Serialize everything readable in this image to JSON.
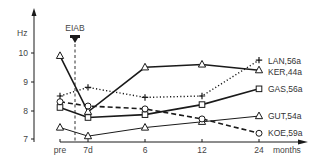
{
  "chart_data": {
    "type": "line",
    "title": "",
    "xlabel": "months",
    "ylabel": "Hz",
    "categories": [
      "pre",
      "7d",
      "6",
      "12",
      "24"
    ],
    "ylim": [
      7,
      10.3
    ],
    "yticks": [
      7,
      8,
      9,
      10
    ],
    "grid": false,
    "legend_position": "right, inline at line ends",
    "annotation": {
      "label": "EIAB",
      "at": "between pre and 7d",
      "marker": "down-arrow with dashed vertical line"
    },
    "series": [
      {
        "name": "LAN,56a",
        "marker": "+",
        "line": "dotted",
        "values": [
          8.5,
          8.8,
          8.45,
          8.5,
          9.75
        ]
      },
      {
        "name": "KER,44a",
        "marker": "triangle",
        "line": "solid-thick",
        "values": [
          9.9,
          7.95,
          9.5,
          9.6,
          9.4
        ]
      },
      {
        "name": "GAS,56a",
        "marker": "square",
        "line": "solid-thick",
        "values": [
          8.1,
          7.75,
          7.85,
          8.2,
          8.75
        ]
      },
      {
        "name": "GUT,54a",
        "marker": "triangle",
        "line": "solid-thin",
        "values": [
          7.4,
          7.1,
          7.4,
          7.6,
          7.8
        ]
      },
      {
        "name": "KOE,59a",
        "marker": "circle",
        "line": "dashed",
        "values": [
          8.3,
          8.15,
          8.05,
          7.7,
          7.2
        ]
      }
    ]
  },
  "axes": {
    "y_label": "Hz",
    "x_label": "months",
    "y_tick_labels": [
      "10",
      "9",
      "8",
      "7"
    ],
    "x_tick_labels": [
      "pre",
      "7d",
      "6",
      "12",
      "24"
    ]
  },
  "annotation": {
    "label": "EIAB"
  },
  "legend": {
    "lan": "LAN,56a",
    "ker": "KER,44a",
    "gas": "GAS,56a",
    "gut": "GUT,54a",
    "koe": "KOE,59a"
  },
  "colors": {
    "ink": "#1a1a1a",
    "text": "#333333",
    "background": "#ffffff"
  }
}
